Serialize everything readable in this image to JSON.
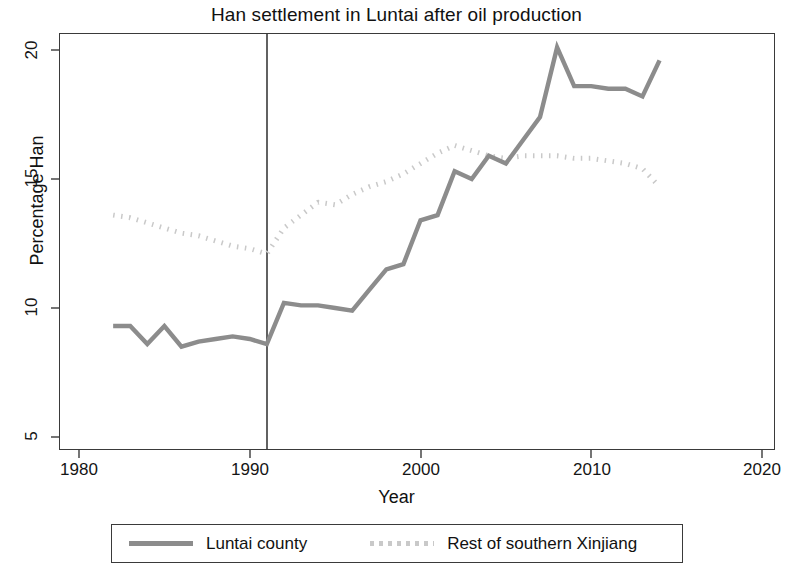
{
  "chart_data": {
    "type": "line",
    "title": "Han settlement in Luntai after oil production",
    "xlabel": "Year",
    "ylabel": "Percentage Han",
    "xlim": [
      1980,
      2020
    ],
    "ylim": [
      4.0,
      21.3
    ],
    "xticks": [
      1980,
      1990,
      2000,
      2010,
      2020
    ],
    "yticks": [
      5,
      10,
      15,
      20
    ],
    "grid": false,
    "legend_position": "bottom",
    "annotations": [
      {
        "type": "vline",
        "x": 1991,
        "label": "oil production start"
      }
    ],
    "series": [
      {
        "name": "Luntai county",
        "style": "solid",
        "color": "#8c8c8c",
        "x": [
          1982,
          1983,
          1984,
          1985,
          1986,
          1987,
          1988,
          1989,
          1990,
          1991,
          1992,
          1993,
          1994,
          1995,
          1996,
          1997,
          1998,
          1999,
          2000,
          2001,
          2002,
          2003,
          2004,
          2005,
          2006,
          2007,
          2008,
          2009,
          2010,
          2011,
          2012,
          2013,
          2014
        ],
        "values": [
          9.3,
          9.3,
          8.6,
          9.3,
          8.5,
          8.7,
          8.8,
          8.9,
          8.8,
          8.6,
          10.2,
          10.1,
          10.1,
          10.0,
          9.9,
          10.7,
          11.5,
          11.7,
          13.4,
          13.6,
          15.3,
          15.0,
          15.9,
          15.6,
          16.5,
          17.4,
          20.1,
          18.6,
          18.6,
          18.5,
          18.5,
          18.2,
          19.6
        ]
      },
      {
        "name": "Rest of southern Xinjiang",
        "style": "dotted",
        "color": "#c9c9c9",
        "x": [
          1982,
          1983,
          1984,
          1985,
          1986,
          1987,
          1988,
          1989,
          1990,
          1991,
          1992,
          1993,
          1994,
          1995,
          1996,
          1997,
          1998,
          1999,
          2000,
          2001,
          2002,
          2003,
          2004,
          2005,
          2006,
          2007,
          2008,
          2009,
          2010,
          2011,
          2012,
          2013,
          2014
        ],
        "values": [
          13.6,
          13.5,
          13.3,
          13.1,
          12.9,
          12.8,
          12.6,
          12.4,
          12.3,
          12.1,
          13.1,
          13.6,
          14.1,
          14.0,
          14.4,
          14.7,
          14.9,
          15.2,
          15.6,
          16.0,
          16.3,
          16.1,
          15.9,
          15.8,
          15.9,
          15.9,
          15.9,
          15.8,
          15.8,
          15.7,
          15.6,
          15.4,
          14.7
        ]
      }
    ]
  },
  "title": "Han settlement in Luntai after oil production",
  "axes": {
    "y_title": "Percentage Han",
    "x_title": "Year",
    "y_ticks": [
      "20",
      "15",
      "10",
      "5"
    ],
    "x_ticks": [
      "1980",
      "1990",
      "2000",
      "2010",
      "2020"
    ]
  },
  "legend": {
    "entries": [
      {
        "label": "Luntai county",
        "style": "solid"
      },
      {
        "label": "Rest of southern Xinjiang",
        "style": "dotted"
      }
    ]
  },
  "colors": {
    "luntai_line": "#8c8c8c",
    "rest_line": "#c9c9c9",
    "frame": "#3a3a3a",
    "text": "#111111"
  }
}
